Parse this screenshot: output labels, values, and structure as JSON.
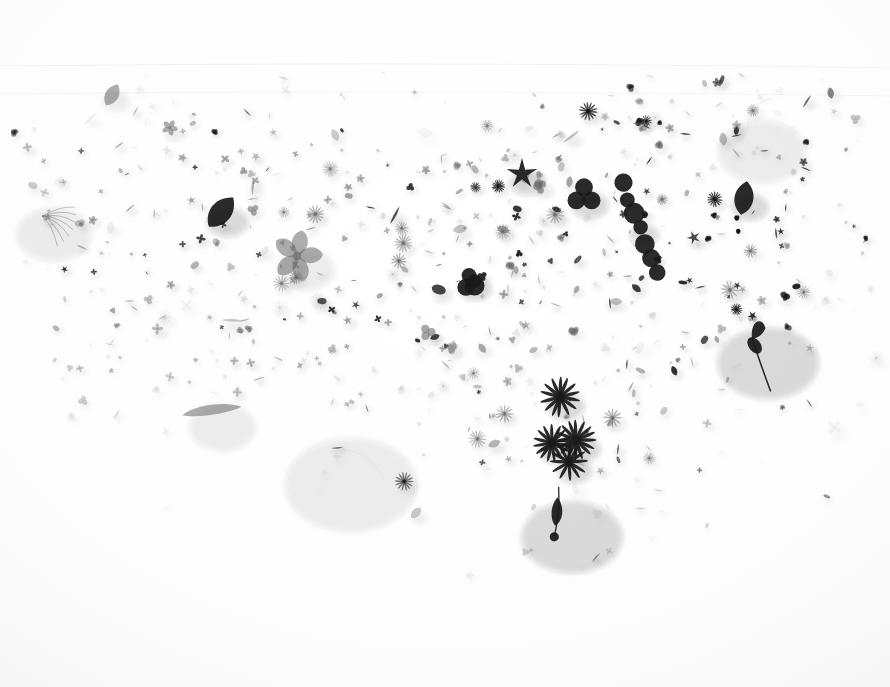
{
  "scene": {
    "title": "Scattered pressed botanical specimens",
    "subject": "flowers, petals, leaves, seeds and twigs arranged in a wide arc",
    "width": 890,
    "height": 687,
    "background_color": "#fdfdfd",
    "paper_tone": "#fcfcfc",
    "specimen_dark": "#1a1a1a",
    "specimen_mid": "#6a6a6a",
    "specimen_light": "#b8b8b8",
    "shadow_color": "rgba(40,40,40,0.18)",
    "lighting": "soft diffuse top-light with short lower-right shadows",
    "composition": "dense arc sweeping from upper-left down through centre and up to upper-right, thinning to empty white at the bottom"
  },
  "seams": [
    {
      "name": "upper-paper-seam",
      "y": 64,
      "opacity": 0.05
    },
    {
      "name": "mid-paper-seam",
      "y": 92,
      "opacity": 0.04
    }
  ],
  "regions": [
    {
      "name": "upper-left-cluster",
      "label": "cross-shaped four-petal blossoms",
      "x": 60,
      "y": 120,
      "w": 300,
      "h": 200,
      "density": "high",
      "tone": "mid"
    },
    {
      "name": "left-sparse-field",
      "label": "scattered petals and seeds",
      "x": 20,
      "y": 180,
      "w": 120,
      "h": 180,
      "density": "low",
      "tone": "light"
    },
    {
      "name": "centre-field",
      "label": "small petals, leaves and slender husks",
      "x": 360,
      "y": 150,
      "w": 180,
      "h": 240,
      "density": "medium",
      "tone": "light"
    },
    {
      "name": "right-dark-cluster",
      "label": "dark round petals and berry chain",
      "x": 560,
      "y": 150,
      "w": 200,
      "h": 180,
      "density": "high",
      "tone": "dark"
    },
    {
      "name": "upper-right-cluster",
      "label": "grey clustered blossoms",
      "x": 580,
      "y": 100,
      "w": 220,
      "h": 130,
      "density": "high",
      "tone": "mid"
    },
    {
      "name": "lower-centre-daisies",
      "label": "radiating daisy flowerheads",
      "x": 520,
      "y": 380,
      "w": 140,
      "h": 120,
      "density": "medium",
      "tone": "dark"
    },
    {
      "name": "bottom-stem",
      "label": "single stem with leaf and terminal berry",
      "x": 520,
      "y": 480,
      "w": 80,
      "h": 90,
      "density": "low",
      "tone": "dark"
    },
    {
      "name": "right-twig",
      "label": "twig bearing two dark leaves",
      "x": 730,
      "y": 310,
      "w": 100,
      "h": 90,
      "density": "low",
      "tone": "dark"
    },
    {
      "name": "empty-lower-field",
      "label": "blank white paper",
      "x": 0,
      "y": 560,
      "w": 890,
      "h": 127,
      "density": "none",
      "tone": "paper"
    }
  ],
  "landmarks": [
    {
      "name": "grass-spray-left",
      "type": "spray",
      "x": 42,
      "y": 216,
      "size": 34,
      "angle": 25,
      "tone": "mid"
    },
    {
      "name": "large-five-petal-flower",
      "type": "flower5",
      "x": 297,
      "y": 256,
      "size": 26,
      "angle": 15,
      "tone": "mid"
    },
    {
      "name": "dark-round-leaf-centre",
      "type": "leaf",
      "x": 221,
      "y": 212,
      "size": 19,
      "angle": 40,
      "tone": "dark"
    },
    {
      "name": "dark-star-flower",
      "type": "star5",
      "x": 522,
      "y": 174,
      "size": 16,
      "angle": 0,
      "tone": "dark"
    },
    {
      "name": "trefoil-dark-petal",
      "type": "trefoil",
      "x": 584,
      "y": 196,
      "size": 17,
      "angle": 0,
      "tone": "dark"
    },
    {
      "name": "berry-chain-diagonal",
      "type": "chain",
      "x": 640,
      "y": 228,
      "size": 13,
      "angle": 38,
      "tone": "dark"
    },
    {
      "name": "dark-berry-cluster-centre",
      "type": "blob",
      "x": 470,
      "y": 281,
      "size": 15,
      "angle": 0,
      "tone": "dark"
    },
    {
      "name": "dark-round-leaf-right",
      "type": "leaf",
      "x": 744,
      "y": 198,
      "size": 17,
      "angle": 10,
      "tone": "dark"
    },
    {
      "name": "daisy-head-upper",
      "type": "daisy",
      "x": 560,
      "y": 397,
      "size": 17,
      "angle": 0,
      "tone": "dark"
    },
    {
      "name": "daisy-head-left",
      "type": "daisy",
      "x": 552,
      "y": 443,
      "size": 16,
      "angle": 0,
      "tone": "dark"
    },
    {
      "name": "daisy-head-right",
      "type": "daisy",
      "x": 576,
      "y": 440,
      "size": 17,
      "angle": 0,
      "tone": "dark"
    },
    {
      "name": "daisy-head-lower",
      "type": "daisy",
      "x": 569,
      "y": 462,
      "size": 16,
      "angle": 0,
      "tone": "dark"
    },
    {
      "name": "stem-with-berry",
      "type": "stemberry",
      "x": 556,
      "y": 512,
      "size": 46,
      "angle": 6,
      "tone": "dark"
    },
    {
      "name": "twig-right-leaves",
      "type": "twig",
      "x": 752,
      "y": 338,
      "size": 46,
      "angle": 35,
      "tone": "dark"
    },
    {
      "name": "long-grey-pod",
      "type": "pod",
      "x": 212,
      "y": 411,
      "size": 30,
      "angle": -8,
      "tone": "mid"
    },
    {
      "name": "thin-arc-filament",
      "type": "filament",
      "x": 330,
      "y": 452,
      "size": 60,
      "angle": 20,
      "tone": "light"
    },
    {
      "name": "curved-stem-upper-right",
      "type": "filament",
      "x": 748,
      "y": 130,
      "size": 40,
      "angle": -60,
      "tone": "light"
    },
    {
      "name": "dark-oval-leaf-topleft",
      "type": "leaf",
      "x": 112,
      "y": 95,
      "size": 12,
      "angle": 30,
      "tone": "mid"
    }
  ],
  "scatter": {
    "seed": 20240517,
    "count": 620,
    "types": [
      "cross4",
      "flower5",
      "daisy",
      "leaf",
      "petal",
      "seed",
      "blob",
      "star5",
      "sliver",
      "trefoil"
    ],
    "arc": {
      "description": "specimens follow a downward parabola, densest at the two shoulders",
      "left_shoulder_x": 180,
      "right_shoulder_x": 660,
      "apex_y": 470,
      "top_y": 100
    }
  }
}
